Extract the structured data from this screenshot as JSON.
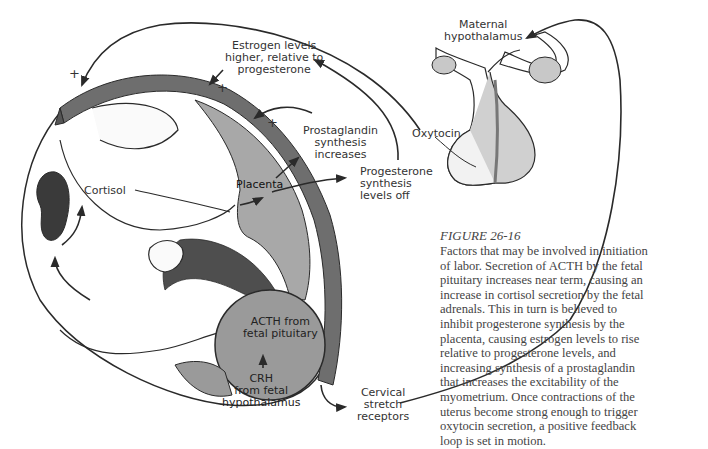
{
  "figure": {
    "labels": {
      "estrogen": [
        "Estrogen levels",
        "higher, relative to",
        "progesterone"
      ],
      "maternal_hypothalamus": [
        "Maternal",
        "hypothalamus"
      ],
      "oxytocin": "Oxytocin",
      "prostaglandin": [
        "Prostaglandin",
        "synthesis",
        "increases"
      ],
      "progesterone": [
        "Progesterone",
        "synthesis",
        "levels off"
      ],
      "placenta": "Placenta",
      "cortisol": "Cortisol",
      "acth": [
        "ACTH from",
        "fetal pituitary"
      ],
      "crh": [
        "CRH",
        "from fetal",
        "hypothalamus"
      ],
      "cervical": [
        "Cervical",
        "stretch",
        "receptors"
      ],
      "plus_sign": "+"
    },
    "colors": {
      "uterine_wall": "#6e6e6e",
      "placenta": "#a8a8a8",
      "fetal_head": "#9a9a9a",
      "pituitary_lobe": "#c8c8c8",
      "line": "#2a2a2a",
      "adrenal": "#3a3a3a"
    }
  },
  "caption": {
    "title": "FIGURE 26-16",
    "lines": [
      "Factors that may be involved in initiation",
      "of labor. Secretion of ACTH by the fetal",
      "pituitary increases near term, causing an",
      "increase in cortisol secretion by the fetal",
      "adrenals. This in turn is believed to",
      "inhibit progesterone synthesis by the",
      "placenta, causing estrogen levels to rise",
      "relative to progesterone levels, and",
      "increasing synthesis of a prostaglandin",
      "that increases the excitability of the",
      "myometrium. Once contractions of the",
      "uterus become strong enough to trigger",
      "oxytocin secretion, a positive feedback",
      "loop is set in motion."
    ]
  }
}
